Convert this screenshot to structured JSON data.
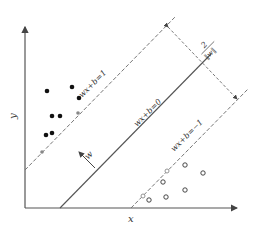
{
  "diagram": {
    "axes": {
      "x_label": "x",
      "y_label": "y"
    },
    "lines": {
      "upper_margin": "wx+b=1",
      "hyperplane": "wx+b=0",
      "lower_margin": "wx+b=−1"
    },
    "normal_vector_label": "w",
    "margin_label": {
      "numerator": "2",
      "denominator": "‖w‖"
    },
    "colors": {
      "ink": "#333333",
      "axis": "#555555",
      "dash": "#777777"
    },
    "class_positive_points": [
      [
        47,
        91
      ],
      [
        72,
        87
      ],
      [
        79,
        98
      ],
      [
        52,
        116
      ],
      [
        60,
        116
      ],
      [
        46,
        135
      ],
      [
        52,
        133
      ]
    ],
    "class_negative_points": [
      [
        185,
        165
      ],
      [
        203,
        173
      ],
      [
        163,
        182
      ],
      [
        185,
        190
      ],
      [
        149,
        200
      ],
      [
        166,
        197
      ]
    ],
    "support_vectors_positive": [
      [
        78,
        113
      ],
      [
        42,
        152
      ]
    ],
    "support_vectors_negative": [
      [
        167,
        171
      ],
      [
        143,
        196
      ]
    ]
  }
}
